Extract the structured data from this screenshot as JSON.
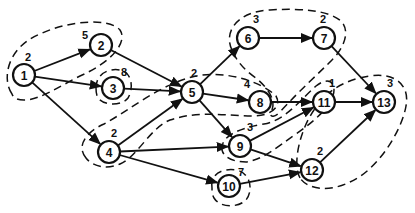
{
  "diagram": {
    "type": "directed-graph-with-clusters",
    "nodes": [
      {
        "id": "1",
        "label": "1",
        "weight": "2",
        "x": 24,
        "y": 75,
        "wx": 4,
        "wy": -14
      },
      {
        "id": "2",
        "label": "2",
        "weight": "5",
        "x": 101,
        "y": 45,
        "wx": -16,
        "wy": -6
      },
      {
        "id": "3",
        "label": "3",
        "weight": "8",
        "x": 113,
        "y": 88,
        "wx": 11,
        "wy": -12
      },
      {
        "id": "4",
        "label": "4",
        "weight": "2",
        "x": 109,
        "y": 152,
        "wx": 5,
        "wy": -15
      },
      {
        "id": "5",
        "label": "5",
        "weight": "2",
        "x": 192,
        "y": 92,
        "wx": 2,
        "wy": -15
      },
      {
        "id": "6",
        "label": "6",
        "weight": "3",
        "x": 248,
        "y": 38,
        "wx": 8,
        "wy": -15
      },
      {
        "id": "7",
        "label": "7",
        "weight": "2",
        "x": 324,
        "y": 38,
        "wx": -1,
        "wy": -15
      },
      {
        "id": "8",
        "label": "8",
        "weight": "4",
        "x": 260,
        "y": 102,
        "wx": -13,
        "wy": -14
      },
      {
        "id": "9",
        "label": "9",
        "weight": "3",
        "x": 240,
        "y": 146,
        "wx": 10,
        "wy": -15
      },
      {
        "id": "10",
        "label": "10",
        "weight": "7",
        "x": 229,
        "y": 186,
        "wx": 12,
        "wy": -10
      },
      {
        "id": "11",
        "label": "11",
        "weight": "1",
        "x": 324,
        "y": 102,
        "wx": 8,
        "wy": -15
      },
      {
        "id": "12",
        "label": "12",
        "weight": "2",
        "x": 312,
        "y": 170,
        "wx": 8,
        "wy": -15
      },
      {
        "id": "13",
        "label": "13",
        "weight": "3",
        "x": 384,
        "y": 102,
        "wx": 6,
        "wy": -15
      }
    ],
    "edges": [
      {
        "from": "1",
        "to": "2"
      },
      {
        "from": "1",
        "to": "3"
      },
      {
        "from": "1",
        "to": "4"
      },
      {
        "from": "2",
        "to": "5"
      },
      {
        "from": "3",
        "to": "5"
      },
      {
        "from": "4",
        "to": "5"
      },
      {
        "from": "4",
        "to": "9"
      },
      {
        "from": "4",
        "to": "10"
      },
      {
        "from": "5",
        "to": "6"
      },
      {
        "from": "5",
        "to": "8"
      },
      {
        "from": "5",
        "to": "9"
      },
      {
        "from": "6",
        "to": "7"
      },
      {
        "from": "7",
        "to": "13"
      },
      {
        "from": "8",
        "to": "11"
      },
      {
        "from": "9",
        "to": "11"
      },
      {
        "from": "9",
        "to": "12"
      },
      {
        "from": "10",
        "to": "12"
      },
      {
        "from": "11",
        "to": "13"
      },
      {
        "from": "12",
        "to": "13"
      }
    ],
    "clusters": [
      {
        "name": "cluster-1-2",
        "path": "M 12 94 C 2 80, 6 48, 40 34 C 70 20, 110 18, 120 30 C 128 42, 112 62, 80 76 C 60 86, 40 100, 24 100 C 16 100, 13 97, 12 94 Z"
      },
      {
        "name": "cluster-3",
        "path": "M 96 88 C 96 74, 108 68, 120 70 C 132 72, 134 88, 128 98 C 122 106, 104 106, 98 98 C 96 94, 96 91, 96 88 Z"
      },
      {
        "name": "cluster-4-5-8",
        "path": "M 86 158 C 76 146, 86 132, 104 124 C 130 110, 160 84, 196 76 C 226 70, 262 82, 276 96 C 282 106, 272 116, 252 116 C 226 116, 200 110, 170 120 C 150 128, 138 156, 120 164 C 106 170, 92 166, 86 158 Z"
      },
      {
        "name": "cluster-6-7-8",
        "path": "M 232 50 C 224 34, 234 12, 270 10 C 300 8, 330 10, 342 22 C 350 32, 344 48, 332 60 C 316 76, 300 90, 280 112 C 274 118, 268 118, 272 110 C 276 100, 268 88, 256 78 C 244 70, 236 60, 232 50 Z"
      },
      {
        "name": "cluster-9-11",
        "path": "M 222 150 C 220 136, 240 128, 264 124 C 286 120, 300 100, 316 86 C 326 78, 334 80, 334 90 C 334 104, 316 120, 296 134 C 276 148, 262 160, 246 162 C 234 162, 224 158, 222 150 Z"
      },
      {
        "name": "cluster-10",
        "path": "M 212 188 C 210 174, 222 168, 236 170 C 250 172, 254 190, 246 200 C 238 208, 220 208, 214 198 C 212 195, 212 191, 212 188 Z"
      },
      {
        "name": "cluster-11-12-13",
        "path": "M 300 178 C 292 164, 300 130, 314 110 C 322 96, 340 80, 370 76 C 396 72, 410 86, 406 106 C 402 130, 378 170, 350 182 C 330 192, 308 190, 300 178 Z"
      }
    ],
    "node_radius": 11
  }
}
